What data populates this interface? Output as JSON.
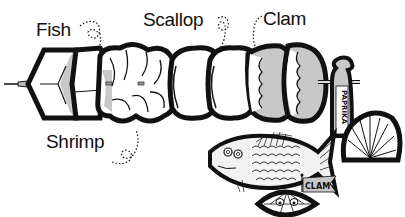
{
  "illustration": {
    "subject": "Seafood kebab clip art",
    "labels": {
      "fish": "Fish",
      "scallop": "Scallop",
      "clam": "Clam",
      "shrimp": "Shrimp"
    },
    "shaker_label": "PAPRIKA",
    "flag_label": "CLAM",
    "colors": {
      "ink": "#111111",
      "shade": "#c8c8c8",
      "background": "#ffffff"
    }
  }
}
